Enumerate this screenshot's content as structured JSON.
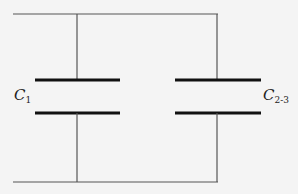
{
  "diagram": {
    "type": "circuit",
    "components": [
      {
        "id": "c1",
        "label": "C",
        "subscript": "1"
      },
      {
        "id": "c23",
        "label": "C",
        "subscript": "2-3"
      }
    ],
    "colors": {
      "wire": "#555555",
      "plate": "#111111",
      "background": "#f4f4f4"
    }
  }
}
